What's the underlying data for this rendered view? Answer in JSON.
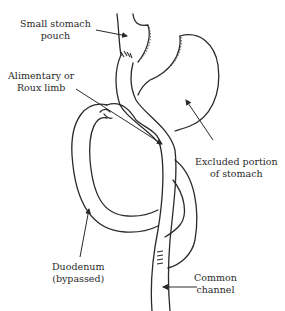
{
  "diagram": {
    "type": "Roux-en-Y gastric bypass anatomy illustration",
    "stroke_color": "#2a2a2a",
    "labels": {
      "small_stomach_pouch": [
        "Small stomach",
        "pouch"
      ],
      "alimentary_limb": [
        "Alimentary or",
        "Roux limb"
      ],
      "excluded_stomach": [
        "Excluded portion",
        "of stomach"
      ],
      "duodenum": [
        "Duodenum",
        "(bypassed)"
      ],
      "common_channel": [
        "Common",
        "channel"
      ]
    }
  }
}
